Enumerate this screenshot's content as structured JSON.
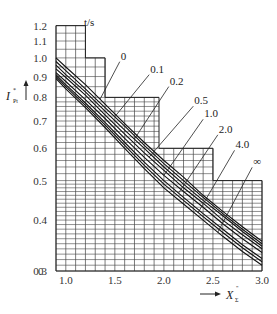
{
  "chart_data": {
    "type": "line",
    "title": "",
    "xlabel": "X''Σ",
    "ylabel": "I*P t",
    "legend_title": "t/s",
    "x_zero_label": "0",
    "xlim": [
      0.9,
      3.0
    ],
    "ylim": [
      0.3,
      1.2
    ],
    "y_scale": "log",
    "grid": true,
    "x_ticks": [
      "1.0",
      "1.5",
      "2.0",
      "2.5",
      "3.0"
    ],
    "y_ticks": [
      "1.2",
      "1.1",
      "1.0",
      "0.9",
      "0.8",
      "0.7",
      "0.6",
      "0.5",
      "0.4",
      "0.3"
    ],
    "x": [
      0.9,
      1.0,
      1.2,
      1.4,
      1.6,
      1.8,
      2.0,
      2.2,
      2.4,
      2.6,
      2.8,
      3.0
    ],
    "series": [
      {
        "name": "0",
        "values": [
          1.0,
          0.95,
          0.86,
          0.77,
          0.69,
          0.62,
          0.56,
          0.51,
          0.46,
          0.42,
          0.385,
          0.355
        ]
      },
      {
        "name": "0.1",
        "values": [
          0.98,
          0.93,
          0.84,
          0.755,
          0.68,
          0.61,
          0.55,
          0.5,
          0.455,
          0.415,
          0.38,
          0.35
        ]
      },
      {
        "name": "0.2",
        "values": [
          0.96,
          0.91,
          0.825,
          0.74,
          0.665,
          0.6,
          0.54,
          0.49,
          0.447,
          0.41,
          0.375,
          0.345
        ]
      },
      {
        "name": "0.5",
        "values": [
          0.94,
          0.895,
          0.81,
          0.725,
          0.65,
          0.585,
          0.53,
          0.48,
          0.44,
          0.4,
          0.368,
          0.34
        ]
      },
      {
        "name": "1.0",
        "values": [
          0.92,
          0.875,
          0.79,
          0.71,
          0.635,
          0.57,
          0.515,
          0.47,
          0.43,
          0.392,
          0.36,
          0.333
        ]
      },
      {
        "name": "2.0",
        "values": [
          0.91,
          0.86,
          0.775,
          0.695,
          0.62,
          0.555,
          0.5,
          0.455,
          0.415,
          0.38,
          0.348,
          0.322
        ]
      },
      {
        "name": "4.0",
        "values": [
          0.9,
          0.85,
          0.765,
          0.685,
          0.61,
          0.545,
          0.49,
          0.447,
          0.408,
          0.373,
          0.342,
          0.316
        ]
      },
      {
        "name": "∞",
        "values": [
          0.89,
          0.84,
          0.755,
          0.675,
          0.6,
          0.535,
          0.48,
          0.438,
          0.4,
          0.365,
          0.335,
          0.31
        ]
      }
    ],
    "label_positions": [
      {
        "name": "0",
        "x": 1.55,
        "y": 0.99
      },
      {
        "name": "0.1",
        "x": 1.85,
        "y": 0.92
      },
      {
        "name": "0.2",
        "x": 2.05,
        "y": 0.86
      },
      {
        "name": "0.5",
        "x": 2.3,
        "y": 0.77
      },
      {
        "name": "1.0",
        "x": 2.4,
        "y": 0.715
      },
      {
        "name": "2.0",
        "x": 2.55,
        "y": 0.655
      },
      {
        "name": "4.0",
        "x": 2.72,
        "y": 0.6
      },
      {
        "name": "∞",
        "x": 2.9,
        "y": 0.545
      }
    ],
    "grid_region_steps": [
      {
        "x_from": 0.9,
        "x_to": 1.2,
        "y_top": 1.2
      },
      {
        "x_from": 1.2,
        "x_to": 1.4,
        "y_top": 1.0
      },
      {
        "x_from": 1.4,
        "x_to": 1.95,
        "y_top": 0.8
      },
      {
        "x_from": 1.95,
        "x_to": 2.5,
        "y_top": 0.6
      },
      {
        "x_from": 2.5,
        "x_to": 3.0,
        "y_top": 0.5
      }
    ]
  }
}
